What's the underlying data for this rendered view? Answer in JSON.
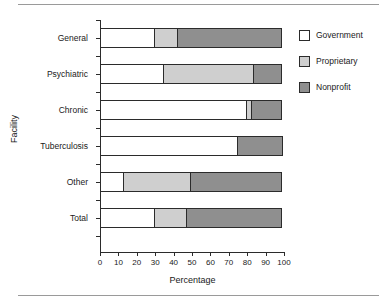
{
  "figure": {
    "has_top_rule": true,
    "has_bottom_rule": true
  },
  "chart_data": {
    "type": "bar",
    "orientation": "horizontal",
    "stacked": true,
    "title": "",
    "xlabel": "Percentage",
    "ylabel": "Facility",
    "xlim": [
      0,
      100
    ],
    "xticks": [
      "0",
      "10",
      "20",
      "30",
      "40",
      "50",
      "60",
      "70",
      "80",
      "90",
      "100"
    ],
    "grid": false,
    "legend_position": "right",
    "categories": [
      "General",
      "Psychiatric",
      "Chronic",
      "Tuberculosis",
      "Other",
      "Total"
    ],
    "series": [
      {
        "name": "Government",
        "color": "#ffffff",
        "values": [
          30,
          35,
          80,
          75,
          13,
          30
        ]
      },
      {
        "name": "Proprietary",
        "color": "#cfcfcf",
        "values": [
          13,
          49,
          3,
          0,
          37,
          18
        ]
      },
      {
        "name": "Nonprofit",
        "color": "#8f8f8f",
        "values": [
          57,
          16,
          17,
          25,
          50,
          52
        ]
      }
    ]
  },
  "legend": {
    "items": [
      {
        "label": "Government",
        "color": "#ffffff"
      },
      {
        "label": "Proprietary",
        "color": "#cfcfcf"
      },
      {
        "label": "Nonprofit",
        "color": "#8f8f8f"
      }
    ]
  },
  "colors": {
    "axis": "#2b2b2b",
    "rule": "#9a9a9a",
    "text": "#1a1a1a"
  }
}
